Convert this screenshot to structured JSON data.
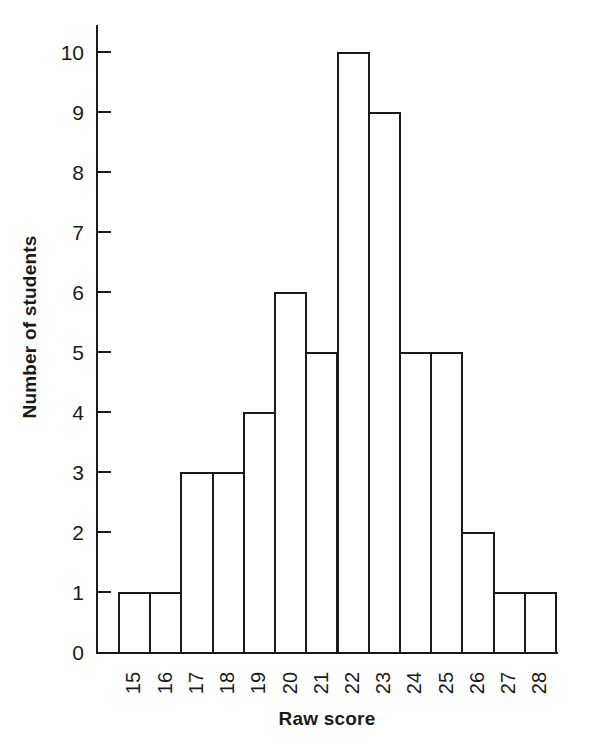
{
  "chart_data": {
    "type": "bar",
    "title": "",
    "subtitle": "",
    "xlabel": "Raw score",
    "ylabel": "Number of students",
    "categories": [
      "15",
      "16",
      "17",
      "18",
      "19",
      "20",
      "21",
      "22",
      "23",
      "24",
      "25",
      "26",
      "27",
      "28"
    ],
    "values": [
      1,
      1,
      3,
      3,
      4,
      6,
      5,
      10,
      9,
      5,
      5,
      2,
      1,
      1
    ],
    "xlim": [
      15,
      28
    ],
    "ylim": [
      0,
      10
    ],
    "yticks": [
      "0",
      "1",
      "2",
      "3",
      "4",
      "5",
      "6",
      "7",
      "8",
      "9",
      "10"
    ],
    "ytick_values": [
      0,
      1,
      2,
      3,
      4,
      5,
      6,
      7,
      8,
      9,
      10
    ],
    "grid": false,
    "legend": null,
    "legend_position": "none",
    "annotations": [],
    "xtick_rotation": 90,
    "ylabel_rotation": 90,
    "bar_style": "outlined-adjacent",
    "colors": {
      "bar_fill": "#ffffff",
      "bar_edge": "#1a1a1a",
      "axis": "#1a1a1a",
      "text": "#1a1a1a",
      "background": "#ffffff"
    }
  }
}
